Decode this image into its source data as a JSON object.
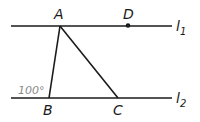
{
  "figure": {
    "lines": {
      "l1": {
        "label": "l",
        "subscript": "1"
      },
      "l2": {
        "label": "l",
        "subscript": "2"
      }
    },
    "points": {
      "A": "A",
      "B": "B",
      "C": "C",
      "D": "D"
    },
    "angle_label": "100°",
    "colors": {
      "stroke": "#1a1a1a",
      "angle": "#8a8a8a"
    }
  }
}
